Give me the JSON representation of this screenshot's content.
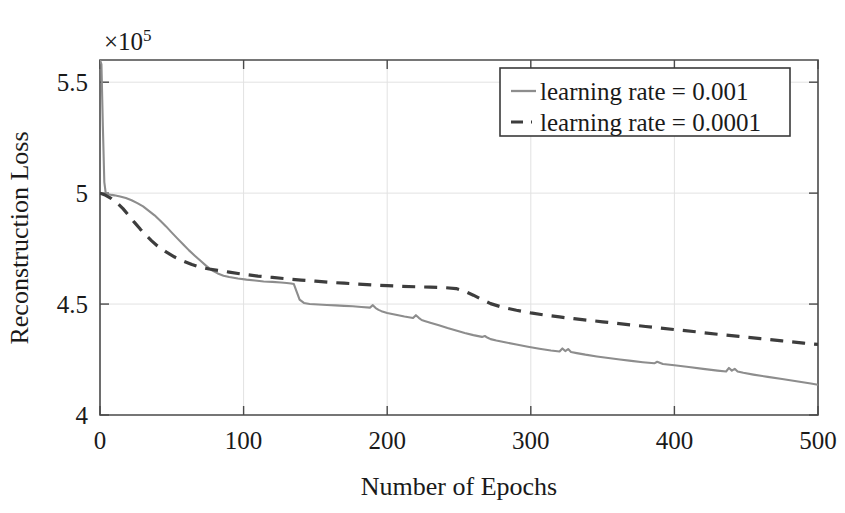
{
  "chart_data": {
    "type": "line",
    "title": "",
    "xlabel": "Number of Epochs",
    "ylabel": "Reconstruction Loss",
    "y_exponent_label": "×10",
    "y_exponent_power": "5",
    "y_scale": 100000,
    "xlim": [
      0,
      500
    ],
    "ylim": [
      4.0,
      5.6
    ],
    "xticks": [
      0,
      100,
      200,
      300,
      400,
      500
    ],
    "xtick_labels": [
      "0",
      "100",
      "200",
      "300",
      "400",
      "500"
    ],
    "yticks": [
      4,
      4.5,
      5,
      5.5
    ],
    "ytick_labels": [
      "4",
      "4.5",
      "5",
      "5.5"
    ],
    "grid": true,
    "legend_position": "top-right",
    "series": [
      {
        "name": "learning rate = 0.001",
        "style": "solid",
        "color": "#8d8d8d",
        "x": [
          0,
          1,
          2,
          3,
          4,
          6,
          8,
          10,
          14,
          18,
          22,
          26,
          30,
          34,
          38,
          42,
          46,
          50,
          54,
          58,
          62,
          66,
          70,
          74,
          78,
          82,
          86,
          90,
          96,
          102,
          108,
          114,
          120,
          126,
          130,
          133,
          135,
          137,
          139,
          142,
          146,
          152,
          158,
          164,
          170,
          176,
          182,
          188,
          190,
          192,
          194,
          196,
          200,
          206,
          212,
          218,
          220,
          222,
          224,
          226,
          230,
          236,
          242,
          248,
          254,
          260,
          266,
          268,
          270,
          272,
          276,
          282,
          290,
          298,
          306,
          314,
          320,
          322,
          324,
          326,
          328,
          332,
          338,
          346,
          354,
          362,
          370,
          378,
          386,
          388,
          392,
          400,
          410,
          420,
          430,
          436,
          438,
          440,
          442,
          444,
          448,
          455,
          465,
          475,
          485,
          495,
          500
        ],
        "y": [
          5.6,
          5.58,
          5.3,
          5.05,
          5.0,
          4.995,
          4.992,
          4.99,
          4.985,
          4.978,
          4.968,
          4.955,
          4.94,
          4.92,
          4.9,
          4.875,
          4.85,
          4.822,
          4.795,
          4.768,
          4.742,
          4.718,
          4.695,
          4.672,
          4.652,
          4.638,
          4.628,
          4.622,
          4.615,
          4.61,
          4.606,
          4.602,
          4.6,
          4.597,
          4.595,
          4.593,
          4.59,
          4.555,
          4.52,
          4.505,
          4.5,
          4.498,
          4.496,
          4.494,
          4.492,
          4.49,
          4.487,
          4.484,
          4.495,
          4.482,
          4.474,
          4.468,
          4.46,
          4.452,
          4.444,
          4.437,
          4.45,
          4.438,
          4.428,
          4.424,
          4.416,
          4.404,
          4.392,
          4.381,
          4.37,
          4.36,
          4.352,
          4.356,
          4.348,
          4.342,
          4.336,
          4.328,
          4.318,
          4.308,
          4.299,
          4.291,
          4.286,
          4.3,
          4.288,
          4.297,
          4.284,
          4.279,
          4.272,
          4.264,
          4.257,
          4.25,
          4.244,
          4.238,
          4.233,
          4.24,
          4.23,
          4.224,
          4.216,
          4.208,
          4.2,
          4.196,
          4.212,
          4.2,
          4.208,
          4.196,
          4.19,
          4.182,
          4.172,
          4.162,
          4.152,
          4.142,
          4.136
        ]
      },
      {
        "name": "learning rate = 0.0001",
        "style": "dashed",
        "color": "#3d3d3d",
        "x": [
          0,
          4,
          8,
          12,
          16,
          20,
          24,
          28,
          32,
          36,
          40,
          46,
          52,
          58,
          64,
          70,
          76,
          82,
          90,
          100,
          110,
          120,
          130,
          140,
          150,
          160,
          170,
          180,
          190,
          200,
          210,
          220,
          230,
          240,
          248,
          254,
          260,
          266,
          272,
          280,
          290,
          300,
          310,
          320,
          330,
          340,
          350,
          360,
          370,
          380,
          390,
          400,
          415,
          430,
          445,
          460,
          475,
          490,
          500
        ],
        "y": [
          5.0,
          4.99,
          4.975,
          4.955,
          4.93,
          4.9,
          4.868,
          4.838,
          4.81,
          4.785,
          4.762,
          4.735,
          4.712,
          4.694,
          4.678,
          4.666,
          4.658,
          4.652,
          4.644,
          4.634,
          4.626,
          4.62,
          4.614,
          4.608,
          4.603,
          4.598,
          4.594,
          4.59,
          4.586,
          4.583,
          4.58,
          4.578,
          4.576,
          4.574,
          4.57,
          4.558,
          4.54,
          4.52,
          4.502,
          4.486,
          4.472,
          4.46,
          4.45,
          4.442,
          4.434,
          4.427,
          4.42,
          4.413,
          4.406,
          4.399,
          4.392,
          4.385,
          4.375,
          4.364,
          4.354,
          4.344,
          4.334,
          4.324,
          4.318
        ]
      }
    ],
    "annotations": [
      {
        "name": "initial-spike",
        "description": "solid curve begins clipped at top of axis near 5.6 and drops to 5.0 by epoch 4"
      },
      {
        "name": "step-135",
        "description": "solid curve steps down near epoch 135"
      },
      {
        "name": "step-270",
        "description": "solid curve steps down near epoch 270"
      },
      {
        "name": "spikes",
        "description": "small upward spikes on solid curve near epochs 190, 220, 270, 322, 390, 438"
      }
    ]
  },
  "legend": {
    "entries": [
      {
        "label": "learning rate = 0.001",
        "style": "solid"
      },
      {
        "label": "learning rate = 0.0001",
        "style": "dashed"
      }
    ]
  },
  "axes": {
    "x_title": "Number of Epochs",
    "y_title": "Reconstruction Loss",
    "exponent_prefix": "×10",
    "exponent_power": "5"
  }
}
